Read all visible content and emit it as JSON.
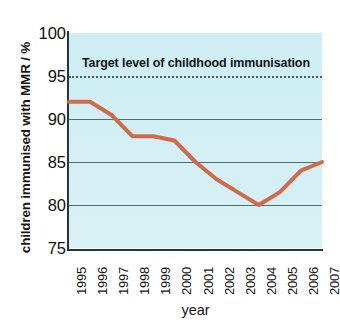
{
  "chart_data": {
    "type": "line",
    "title": "",
    "xlabel": "year",
    "ylabel": "children immunised with MMR / %",
    "categories": [
      "1995",
      "1996",
      "1997",
      "1998",
      "1999",
      "2000",
      "2001",
      "2002",
      "2003",
      "2004",
      "2005",
      "2006",
      "2007"
    ],
    "values": [
      92,
      92,
      90.5,
      88,
      88,
      87.5,
      85,
      83,
      81.5,
      80,
      81.5,
      84,
      85
    ],
    "series": [
      {
        "name": "children immunised with MMR",
        "values": [
          92,
          92,
          90.5,
          88,
          88,
          87.5,
          85,
          83,
          81.5,
          80,
          81.5,
          84,
          85
        ]
      }
    ],
    "ylim": [
      75,
      100
    ],
    "yticks": [
      75,
      80,
      85,
      90,
      95,
      100
    ],
    "ytick_labels": [
      "75",
      "80",
      "85",
      "90",
      "95",
      "100"
    ],
    "gridlines": [
      80,
      85,
      90
    ],
    "grid": true,
    "legend": "none",
    "annotations": [
      {
        "name": "target-level",
        "text": "Target level of childhood immunisation",
        "y_value": 95,
        "style": "dotted-horizontal-line"
      }
    ],
    "line_color": "#d2694a",
    "plot_background_color": "#cdecf3",
    "gridline_color": "#4d6f74",
    "axis_color": "#23383b",
    "text_color": "#141414"
  },
  "axes": {
    "y_title": "children immunised with MMR / %",
    "x_title": "year"
  }
}
